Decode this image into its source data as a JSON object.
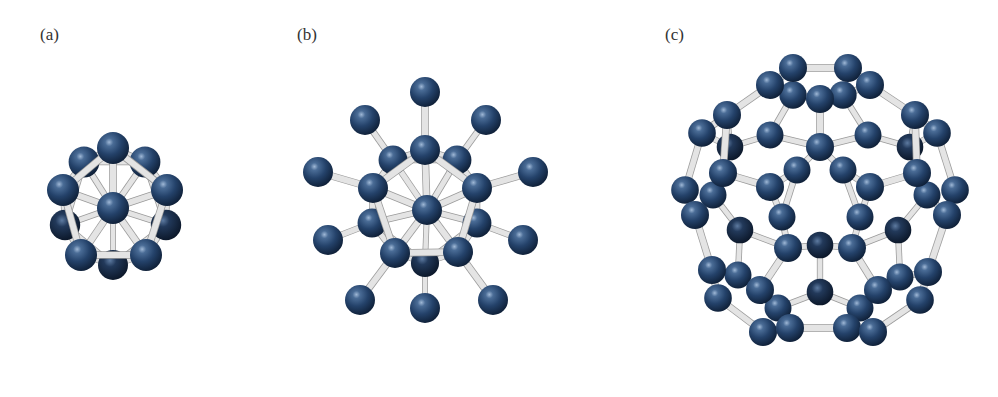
{
  "figure": {
    "width": 998,
    "height": 397,
    "background": "#ffffff",
    "colors": {
      "atom_dark": "#162c4a",
      "atom_mid": "#2b4a72",
      "atom_highlight": "#8aa6c8",
      "bond_fill": "#e4e4e4",
      "bond_edge": "#9a9a9a"
    }
  },
  "panels": [
    {
      "id": "a",
      "label": "(a)",
      "label_pos": [
        40,
        28
      ],
      "description": "icosahedral cluster (12 atoms, 1 central)",
      "atom_radius": 16,
      "atoms": [
        [
          113,
          265,
          0.75
        ],
        [
          65,
          225,
          0.8
        ],
        [
          166,
          225,
          0.8
        ],
        [
          84,
          162,
          0.85
        ],
        [
          145,
          162,
          0.85
        ],
        [
          113,
          148,
          1
        ],
        [
          63,
          190,
          1
        ],
        [
          167,
          190,
          1
        ],
        [
          81,
          255,
          1
        ],
        [
          146,
          255,
          1
        ],
        [
          113,
          208,
          1
        ]
      ],
      "bonds": [
        [
          10,
          5
        ],
        [
          10,
          6
        ],
        [
          10,
          7
        ],
        [
          10,
          8
        ],
        [
          10,
          9
        ],
        [
          10,
          3
        ],
        [
          10,
          4
        ],
        [
          10,
          1
        ],
        [
          10,
          2
        ],
        [
          10,
          0
        ],
        [
          5,
          3
        ],
        [
          5,
          4
        ],
        [
          3,
          6
        ],
        [
          4,
          7
        ],
        [
          6,
          1
        ],
        [
          7,
          2
        ],
        [
          1,
          8
        ],
        [
          2,
          9
        ],
        [
          8,
          0
        ],
        [
          9,
          0
        ],
        [
          5,
          6
        ],
        [
          5,
          7
        ],
        [
          6,
          8
        ],
        [
          7,
          9
        ],
        [
          8,
          9
        ],
        [
          3,
          1
        ],
        [
          4,
          2
        ],
        [
          1,
          0
        ],
        [
          2,
          0
        ],
        [
          3,
          4
        ]
      ]
    },
    {
      "id": "b",
      "label": "(b)",
      "label_pos": [
        297,
        28
      ],
      "description": "icosahedral core with 10 radially bonded outer atoms",
      "atom_radius": 15,
      "atoms": [
        [
          425,
          263,
          0.75
        ],
        [
          372,
          223,
          0.85
        ],
        [
          477,
          223,
          0.85
        ],
        [
          393,
          160,
          0.85
        ],
        [
          457,
          160,
          0.85
        ],
        [
          425,
          92,
          1
        ],
        [
          365,
          120,
          1
        ],
        [
          486,
          120,
          1
        ],
        [
          318,
          172,
          1
        ],
        [
          533,
          172,
          1
        ],
        [
          328,
          240,
          1
        ],
        [
          523,
          240,
          1
        ],
        [
          360,
          300,
          1
        ],
        [
          425,
          308,
          1
        ],
        [
          493,
          300,
          1
        ],
        [
          425,
          150,
          1
        ],
        [
          373,
          188,
          1
        ],
        [
          477,
          188,
          1
        ],
        [
          395,
          253,
          1
        ],
        [
          458,
          252,
          1
        ],
        [
          427,
          210,
          1
        ]
      ],
      "bonds": [
        [
          15,
          5
        ],
        [
          3,
          6
        ],
        [
          4,
          7
        ],
        [
          16,
          8
        ],
        [
          17,
          9
        ],
        [
          1,
          10
        ],
        [
          2,
          11
        ],
        [
          18,
          12
        ],
        [
          0,
          13
        ],
        [
          19,
          14
        ],
        [
          20,
          15
        ],
        [
          20,
          16
        ],
        [
          20,
          17
        ],
        [
          20,
          18
        ],
        [
          20,
          19
        ],
        [
          20,
          3
        ],
        [
          20,
          4
        ],
        [
          20,
          1
        ],
        [
          20,
          2
        ],
        [
          20,
          0
        ],
        [
          15,
          3
        ],
        [
          15,
          4
        ],
        [
          15,
          16
        ],
        [
          15,
          17
        ],
        [
          16,
          1
        ],
        [
          17,
          2
        ],
        [
          16,
          18
        ],
        [
          17,
          19
        ],
        [
          18,
          19
        ],
        [
          18,
          0
        ],
        [
          19,
          0
        ],
        [
          3,
          16
        ],
        [
          4,
          17
        ],
        [
          1,
          18
        ],
        [
          2,
          19
        ],
        [
          3,
          4
        ],
        [
          1,
          0
        ],
        [
          2,
          0
        ]
      ]
    },
    {
      "id": "c",
      "label": "(c)",
      "label_pos": [
        665,
        28
      ],
      "description": "C60-like fullerene cage",
      "atom_radius": 14,
      "atoms": [
        [
          793,
          68,
          1
        ],
        [
          848,
          68,
          1
        ],
        [
          770,
          85,
          1
        ],
        [
          870,
          85,
          1
        ],
        [
          793,
          95,
          0.9
        ],
        [
          843,
          95,
          0.9
        ],
        [
          820,
          99,
          1
        ],
        [
          727,
          115,
          1
        ],
        [
          702,
          133,
          0.95
        ],
        [
          915,
          115,
          1
        ],
        [
          937,
          133,
          0.95
        ],
        [
          770,
          135,
          0.85
        ],
        [
          868,
          135,
          0.85
        ],
        [
          820,
          147,
          1
        ],
        [
          730,
          147,
          0.8
        ],
        [
          910,
          147,
          0.8
        ],
        [
          797,
          170,
          0.85
        ],
        [
          843,
          170,
          0.85
        ],
        [
          723,
          173,
          1
        ],
        [
          917,
          173,
          1
        ],
        [
          770,
          187,
          1
        ],
        [
          870,
          187,
          1
        ],
        [
          685,
          190,
          0.95
        ],
        [
          955,
          190,
          0.95
        ],
        [
          713,
          195,
          0.85
        ],
        [
          927,
          195,
          0.85
        ],
        [
          695,
          215,
          1
        ],
        [
          947,
          215,
          1
        ],
        [
          782,
          217,
          0.85
        ],
        [
          860,
          217,
          0.85
        ],
        [
          740,
          230,
          0.8
        ],
        [
          898,
          230,
          0.8
        ],
        [
          788,
          248,
          1
        ],
        [
          852,
          248,
          1
        ],
        [
          820,
          245,
          0.8
        ],
        [
          712,
          270,
          1
        ],
        [
          928,
          272,
          1
        ],
        [
          738,
          275,
          0.85
        ],
        [
          900,
          277,
          0.85
        ],
        [
          760,
          290,
          1
        ],
        [
          878,
          290,
          1
        ],
        [
          820,
          292,
          0.8
        ],
        [
          718,
          298,
          0.95
        ],
        [
          920,
          300,
          0.95
        ],
        [
          778,
          308,
          0.85
        ],
        [
          860,
          308,
          0.85
        ],
        [
          763,
          332,
          1
        ],
        [
          790,
          328,
          1
        ],
        [
          847,
          328,
          1
        ],
        [
          873,
          332,
          1
        ]
      ],
      "bonds": [
        [
          0,
          1
        ],
        [
          0,
          2
        ],
        [
          1,
          3
        ],
        [
          2,
          4
        ],
        [
          3,
          5
        ],
        [
          4,
          6
        ],
        [
          5,
          6
        ],
        [
          2,
          7
        ],
        [
          3,
          9
        ],
        [
          7,
          8
        ],
        [
          9,
          10
        ],
        [
          6,
          13
        ],
        [
          4,
          11
        ],
        [
          5,
          12
        ],
        [
          11,
          13
        ],
        [
          12,
          13
        ],
        [
          7,
          14
        ],
        [
          9,
          15
        ],
        [
          11,
          14
        ],
        [
          12,
          15
        ],
        [
          13,
          16
        ],
        [
          13,
          17
        ],
        [
          16,
          20
        ],
        [
          17,
          21
        ],
        [
          14,
          18
        ],
        [
          15,
          19
        ],
        [
          18,
          20
        ],
        [
          19,
          21
        ],
        [
          8,
          22
        ],
        [
          10,
          23
        ],
        [
          22,
          26
        ],
        [
          23,
          27
        ],
        [
          18,
          24
        ],
        [
          19,
          25
        ],
        [
          24,
          26
        ],
        [
          25,
          27
        ],
        [
          20,
          28
        ],
        [
          21,
          29
        ],
        [
          28,
          32
        ],
        [
          29,
          33
        ],
        [
          24,
          30
        ],
        [
          25,
          31
        ],
        [
          30,
          32
        ],
        [
          31,
          33
        ],
        [
          32,
          34
        ],
        [
          33,
          34
        ],
        [
          26,
          35
        ],
        [
          27,
          36
        ],
        [
          35,
          37
        ],
        [
          36,
          38
        ],
        [
          37,
          39
        ],
        [
          38,
          40
        ],
        [
          32,
          39
        ],
        [
          33,
          40
        ],
        [
          34,
          41
        ],
        [
          39,
          44
        ],
        [
          40,
          45
        ],
        [
          41,
          44
        ],
        [
          41,
          45
        ],
        [
          35,
          42
        ],
        [
          36,
          43
        ],
        [
          42,
          46
        ],
        [
          43,
          49
        ],
        [
          44,
          47
        ],
        [
          45,
          48
        ],
        [
          46,
          47
        ],
        [
          48,
          49
        ],
        [
          47,
          48
        ],
        [
          30,
          37
        ],
        [
          31,
          38
        ],
        [
          16,
          28
        ],
        [
          17,
          29
        ],
        [
          7,
          18
        ],
        [
          9,
          19
        ],
        [
          8,
          14
        ],
        [
          10,
          15
        ]
      ]
    }
  ]
}
